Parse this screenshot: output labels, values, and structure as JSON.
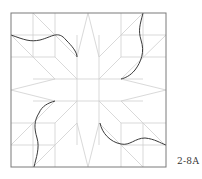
{
  "figure": {
    "label": "2-8A",
    "colors": {
      "frame": "#7a7a7a",
      "grid": "#cfcfcf",
      "curve": "#3a3a3a",
      "background": "#ffffff"
    },
    "frame": {
      "x": 11,
      "y": 13,
      "width": 155,
      "height": 154
    },
    "grid_units": 7
  }
}
